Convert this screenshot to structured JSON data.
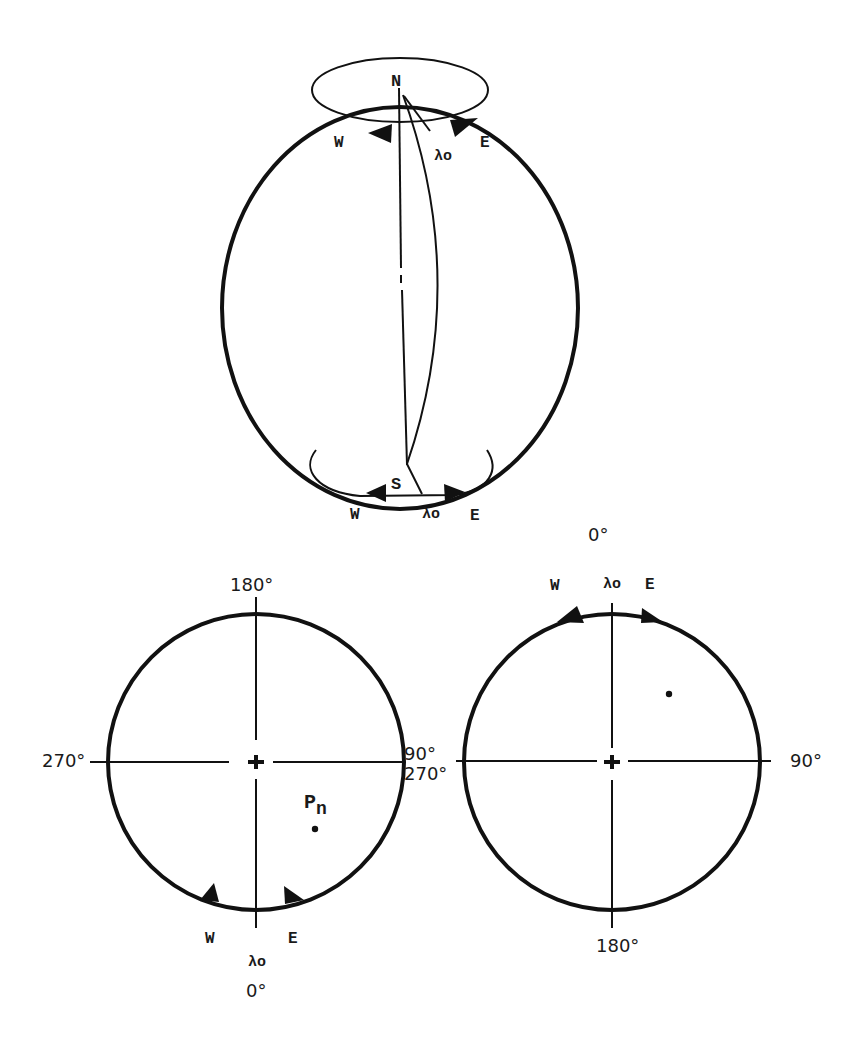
{
  "figure": {
    "globe": {
      "north_label": "N",
      "south_label": "S",
      "north_west_label": "W",
      "north_east_label": "E",
      "north_lambda_label": "λo",
      "south_west_label": "W",
      "south_east_label": "E",
      "south_lambda_label": "λo"
    },
    "left_polar_view": {
      "top_label": "180°",
      "left_label": "270°",
      "right_label": "90°",
      "bottom_label": "0°",
      "lambda_label": "λo",
      "west_label": "W",
      "east_label": "E",
      "point_label": "Pn",
      "point_label_base": "P",
      "point_label_sub": "n"
    },
    "right_polar_view": {
      "top_label": "0°",
      "left_label": "270°",
      "right_label": "90°",
      "bottom_label": "180°",
      "lambda_label": "λo",
      "west_label": "W",
      "east_label": "E"
    },
    "colors": {
      "ink": "#111111",
      "background": "#ffffff"
    }
  }
}
